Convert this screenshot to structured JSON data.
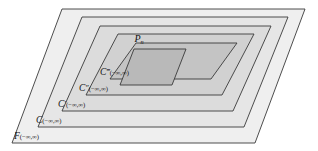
{
  "figure": {
    "background_color": "#ffffff",
    "stroke_color": "#3a3a3a",
    "canvas": {
      "width": 318,
      "height": 151
    },
    "regions": [
      {
        "id": "region-f",
        "name": "F",
        "symbol": "F",
        "primes": "",
        "subscript": "",
        "interval": "(−∞,∞)",
        "label_full": "F(−∞,∞)",
        "fill": "#efefef",
        "depth": 0,
        "label_x": 14,
        "label_y": 139
      },
      {
        "id": "region-c",
        "name": "C",
        "symbol": "C",
        "primes": "",
        "subscript": "",
        "interval": "(−∞,∞)",
        "label_full": "C(−∞,∞)",
        "fill": "#e6e6e6",
        "depth": 1,
        "label_x": 36,
        "label_y": 123
      },
      {
        "id": "region-c-prime",
        "name": "C prime",
        "symbol": "C",
        "primes": "′",
        "subscript": "",
        "interval": "(−∞,∞)",
        "label_full": "C′(−∞,∞)",
        "fill": "#dcdcdc",
        "depth": 2,
        "label_x": 58,
        "label_y": 107
      },
      {
        "id": "region-c-double-prime",
        "name": "C double prime",
        "symbol": "C",
        "primes": "″",
        "subscript": "",
        "interval": "(−∞,∞)",
        "label_full": "C″(−∞,∞)",
        "fill": "#d1d1d1",
        "depth": 3,
        "label_x": 79,
        "label_y": 91
      },
      {
        "id": "region-c-triple-prime",
        "name": "C triple prime",
        "symbol": "C",
        "primes": "‴",
        "subscript": "",
        "interval": "(−∞,∞)",
        "label_full": "C‴(−∞,∞)",
        "fill": "#c4c4c4",
        "depth": 4,
        "label_x": 100,
        "label_y": 75
      },
      {
        "id": "region-pn",
        "name": "P sub n",
        "symbol": "P",
        "primes": "",
        "subscript": "n",
        "interval": "",
        "label_full": "Pₙ",
        "fill": "#b9b9b9",
        "depth": 5,
        "label_x": 139,
        "label_y": 42
      }
    ]
  }
}
